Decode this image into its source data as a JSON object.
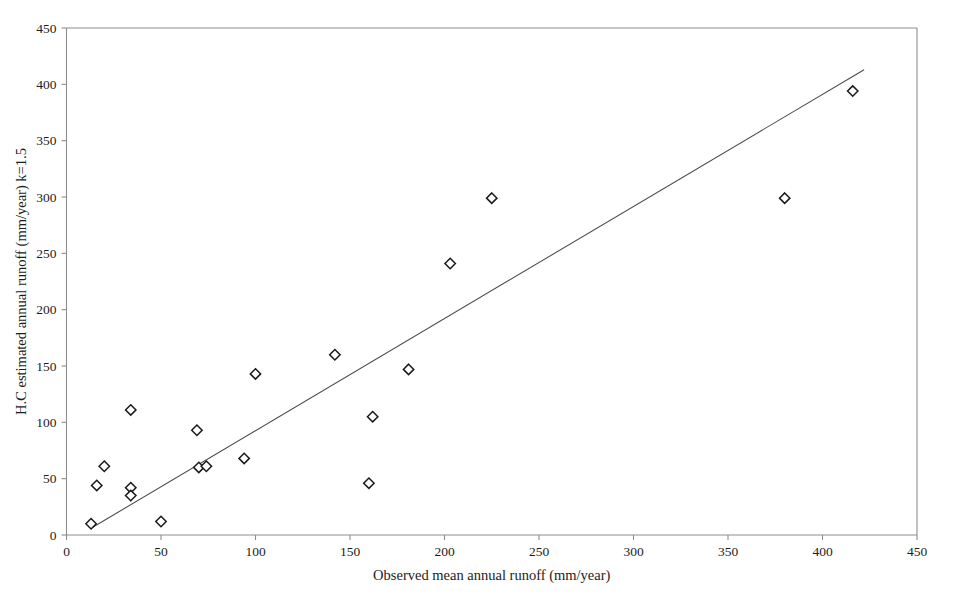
{
  "chart_data": {
    "type": "scatter",
    "title": "",
    "xlabel": "Observed mean annual runoff (mm/year)",
    "ylabel": "H.C estimated annual runoff (mm/year) k=1.5",
    "xlim": [
      0,
      450
    ],
    "ylim": [
      0,
      450
    ],
    "xticks": [
      0,
      50,
      100,
      150,
      200,
      250,
      300,
      350,
      400,
      450
    ],
    "yticks": [
      0,
      50,
      100,
      150,
      200,
      250,
      300,
      350,
      400,
      450
    ],
    "xtick_labels": [
      "0",
      "50",
      "100",
      "150",
      "200",
      "250",
      "300",
      "350",
      "400",
      "450"
    ],
    "ytick_labels": [
      "0",
      "50",
      "100",
      "150",
      "200",
      "250",
      "300",
      "350",
      "400",
      "450"
    ],
    "grid": false,
    "legend": null,
    "marker_style": "open-diamond",
    "series": [
      {
        "name": "Observed vs H.C estimated runoff",
        "points": [
          [
            13,
            10
          ],
          [
            16,
            44
          ],
          [
            20,
            61
          ],
          [
            34,
            111
          ],
          [
            34,
            42
          ],
          [
            34,
            35
          ],
          [
            50,
            12
          ],
          [
            69,
            93
          ],
          [
            70,
            60
          ],
          [
            74,
            61
          ],
          [
            94,
            68
          ],
          [
            100,
            143
          ],
          [
            142,
            160
          ],
          [
            160,
            46
          ],
          [
            162,
            105
          ],
          [
            181,
            147
          ],
          [
            203,
            241
          ],
          [
            225,
            299
          ],
          [
            380,
            299
          ],
          [
            416,
            394
          ]
        ]
      }
    ],
    "trend_line": {
      "name": "linear fit",
      "x_start": 13,
      "y_start": 6,
      "x_end": 422,
      "y_end": 413
    }
  }
}
